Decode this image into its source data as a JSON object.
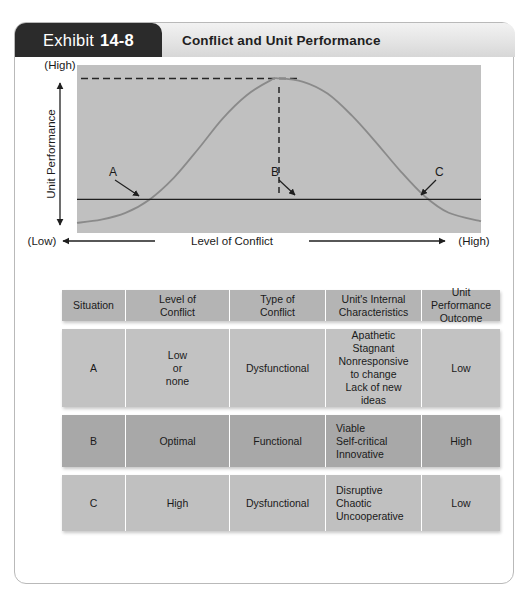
{
  "exhibit": {
    "badge_word": "Exhibit",
    "badge_number": "14-8",
    "title": "Conflict and Unit Performance"
  },
  "chart_data": {
    "type": "line",
    "title": "Conflict and Unit Performance",
    "xlabel": "Level of Conflict",
    "ylabel": "Unit Performance",
    "x_axis_low_label": "(Low)",
    "x_axis_high_label": "(High)",
    "y_axis_low_label": "(Low)",
    "y_axis_high_label": "(High)",
    "xlim": [
      0,
      100
    ],
    "ylim": [
      0,
      100
    ],
    "grid": false,
    "legend": "none",
    "curve_description": "Inverted-U (bell) curve of unit performance versus level of conflict",
    "series": [
      {
        "name": "Unit Performance",
        "x": [
          0,
          6,
          12,
          18,
          24,
          30,
          36,
          42,
          48,
          50,
          56,
          62,
          68,
          74,
          80,
          86,
          92,
          100
        ],
        "y": [
          6,
          8,
          12,
          20,
          33,
          50,
          68,
          82,
          91,
          92,
          90,
          83,
          70,
          54,
          37,
          22,
          12,
          7
        ]
      }
    ],
    "annotations": [
      {
        "label": "A",
        "x": 14,
        "y": 20,
        "note": "Curve crosses baseline on the rising side; low or no conflict"
      },
      {
        "label": "B",
        "x": 50,
        "y": 20,
        "note": "Peak of curve marked by dashed line dropping to baseline; optimal conflict"
      },
      {
        "label": "C",
        "x": 86,
        "y": 20,
        "note": "Curve crosses baseline on the falling side; high conflict"
      }
    ],
    "reference_lines": [
      {
        "orientation": "horizontal",
        "style": "solid",
        "y": 20,
        "note": "Baseline performance reference line"
      },
      {
        "orientation": "horizontal",
        "style": "dashed",
        "y": 92,
        "note": "Peak performance level indicator"
      },
      {
        "orientation": "vertical",
        "style": "dashed",
        "x": 50,
        "note": "Drop line from peak to baseline at point B"
      }
    ]
  },
  "table": {
    "headers": [
      "Situation",
      "Level of\nConflict",
      "Type of\nConflict",
      "Unit's Internal\nCharacteristics",
      "Unit Performance\nOutcome"
    ],
    "rows": [
      {
        "situation": "A",
        "level": "Low\nor\nnone",
        "type": "Dysfunctional",
        "internal": "Apathetic\nStagnant\nNonresponsive\nto change\nLack of new\nideas",
        "outcome": "Low"
      },
      {
        "situation": "B",
        "level": "Optimal",
        "type": "Functional",
        "internal": "Viable\nSelf-critical\nInnovative",
        "outcome": "High"
      },
      {
        "situation": "C",
        "level": "High",
        "type": "Dysfunctional",
        "internal": "Disruptive\nChaotic\nUncooperative",
        "outcome": "Low"
      }
    ]
  }
}
